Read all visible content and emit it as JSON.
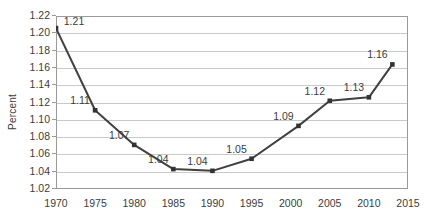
{
  "chart_data": {
    "type": "line",
    "title": "",
    "xlabel": "",
    "ylabel": "Percent",
    "xlim": [
      1970,
      2015
    ],
    "ylim": [
      1.02,
      1.22
    ],
    "ytick_step": 0.02,
    "xtick_step": 5,
    "grid": "horizontal",
    "legend": "none",
    "line_color": "#404040",
    "marker": "square",
    "marker_color": "#333333",
    "gridline_color": "#c9c9c9",
    "axis_color": "#9a9a9a",
    "text_color": "#3c3c3c",
    "x": [
      1970,
      1975,
      1980,
      1985,
      1990,
      1995,
      2001,
      2005,
      2010,
      2013
    ],
    "values": [
      1.206,
      1.111,
      1.071,
      1.043,
      1.041,
      1.055,
      1.093,
      1.122,
      1.126,
      1.164
    ],
    "data_labels": [
      "1.21",
      "1.11",
      "1.07",
      "1.04",
      "1.04",
      "1.05",
      "1.09",
      "1.12",
      "1.13",
      "1.16"
    ],
    "ytick_labels": [
      "1.22",
      "1.20",
      "1.18",
      "1.16",
      "1.14",
      "1.12",
      "1.10",
      "1.08",
      "1.06",
      "1.04",
      "1.02"
    ],
    "ytick_values": [
      1.22,
      1.2,
      1.18,
      1.16,
      1.14,
      1.12,
      1.1,
      1.08,
      1.06,
      1.04,
      1.02
    ],
    "xtick_labels": [
      "1970",
      "1975",
      "1980",
      "1985",
      "1990",
      "1995",
      "2000",
      "2005",
      "2010",
      "2015"
    ],
    "xtick_values": [
      1970,
      1975,
      1980,
      1985,
      1990,
      1995,
      2000,
      2005,
      2010,
      2015
    ]
  }
}
